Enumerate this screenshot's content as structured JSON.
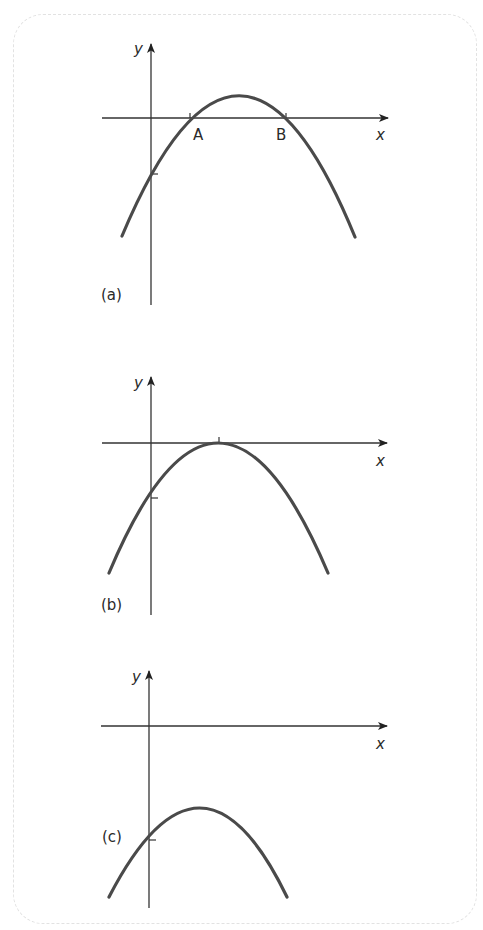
{
  "figure": {
    "panels": [
      {
        "id": "a",
        "label": "(a)",
        "x_axis_label": "x",
        "y_axis_label": "y",
        "root_labels": [
          "A",
          "B"
        ],
        "description": "Downward parabola crossing x-axis at two points A and B; negative y-intercept"
      },
      {
        "id": "b",
        "label": "(b)",
        "x_axis_label": "x",
        "y_axis_label": "y",
        "description": "Downward parabola touching x-axis at one point (vertex on x-axis); negative y-intercept"
      },
      {
        "id": "c",
        "label": "(c)",
        "x_axis_label": "x",
        "y_axis_label": "y",
        "description": "Downward parabola entirely below x-axis; no real roots"
      }
    ],
    "colors": {
      "curve": "#4a4a4a",
      "axes": "#333333",
      "border": "#e2e2e2"
    }
  }
}
